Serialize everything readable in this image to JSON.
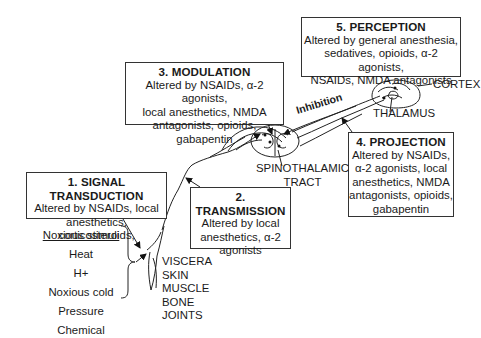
{
  "stages": [
    {
      "id": "signal-transduction",
      "title": "1. SIGNAL TRANSDUCTION",
      "body": "Altered by NSAIDs, local\nanesthetics, corticosteroids,"
    },
    {
      "id": "transmission",
      "title": "2. TRANSMISSION",
      "body": "Altered by local\nanesthetics, α-2\nagonists"
    },
    {
      "id": "modulation",
      "title": "3. MODULATION",
      "body": "Altered by NSAIDs, α-2 agonists,\nlocal anesthetics, NMDA\nantagonists, opioids, gabapentin"
    },
    {
      "id": "projection",
      "title": "4. PROJECTION",
      "body": "Altered by NSAIDs,\nα-2 agonists, local\nanesthetics, NMDA\nantagonists, opioids,\ngabapentin"
    },
    {
      "id": "perception",
      "title": "5. PERCEPTION",
      "body": "Altered by general anesthesia,\nsedatives, opioids, α-2 agonists,\nNSAIDs,  NMDA antagonists"
    }
  ],
  "stimuli": {
    "heading": "Noxious stimuli",
    "items": [
      "Heat",
      "H+",
      "Noxious cold",
      "Pressure",
      "Chemical"
    ]
  },
  "tissues": [
    "VISCERA",
    "SKIN",
    "MUSCLE",
    "BONE",
    "JOINTS"
  ],
  "anatomy_labels": {
    "spinothalamic": "SPINOTHALAMIC\nTRACT",
    "cortex": "CORTEX",
    "thalamus": "THALAMUS",
    "inhibition": "Inhibition"
  }
}
